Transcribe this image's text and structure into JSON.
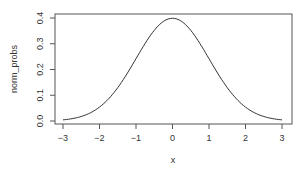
{
  "chart_data": {
    "type": "line",
    "title": "",
    "xlabel": "x",
    "ylabel": "norm_probs",
    "xlim": [
      -3,
      3
    ],
    "ylim": [
      0,
      0.4
    ],
    "x_ticks": [
      "-3",
      "-2",
      "-1",
      "0",
      "1",
      "2",
      "3"
    ],
    "y_ticks": [
      "0.0",
      "0.1",
      "0.2",
      "0.3",
      "0.4"
    ],
    "grid": false,
    "legend": null,
    "series": [
      {
        "name": "norm_probs",
        "description": "standard normal density",
        "x": [
          -3,
          -2.5,
          -2,
          -1.5,
          -1,
          -0.5,
          0,
          0.5,
          1,
          1.5,
          2,
          2.5,
          3
        ],
        "values": [
          0.0044,
          0.0175,
          0.054,
          0.1295,
          0.242,
          0.3521,
          0.3989,
          0.3521,
          0.242,
          0.1295,
          0.054,
          0.0175,
          0.0044
        ]
      }
    ],
    "colors": {
      "line": "#333333",
      "axis": "#555555"
    }
  },
  "labels": {
    "xlabel": "x",
    "ylabel": "norm_probs"
  }
}
